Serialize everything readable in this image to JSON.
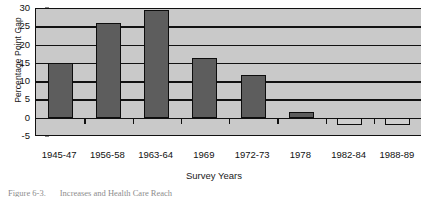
{
  "chart_data": {
    "type": "bar",
    "title": "",
    "xlabel": "Survey Years",
    "ylabel": "Percentage Point Gap",
    "categories": [
      "1945-47",
      "1956-58",
      "1963-64",
      "1969",
      "1972-73",
      "1978",
      "1982-84",
      "1988-89"
    ],
    "values": [
      15,
      26,
      29.5,
      16.3,
      11.8,
      1.5,
      -2,
      -2
    ],
    "ylim": [
      -5,
      30
    ],
    "yticks": [
      -5,
      0,
      5,
      10,
      15,
      20,
      25,
      30
    ],
    "ytick_labels": [
      "-5",
      "0",
      "5",
      "10",
      "15",
      "20",
      "25",
      "30"
    ],
    "grid": true,
    "legend": false,
    "series": [
      {
        "name": "Percentage Point Gap",
        "values": [
          15,
          26,
          29.5,
          16.3,
          11.8,
          1.5,
          -2,
          -2
        ]
      }
    ],
    "colors": {
      "positive_bar_fill": "#5d5d5d",
      "negative_bar_fill": "#cfcfcf",
      "bar_border": "#0d0d0d",
      "plot_background": "#c9c9c9",
      "gridline": "#111111",
      "axis": "#111111"
    }
  },
  "caption": {
    "number": "Figure 6-3.",
    "text": "Increases and Health Care Reach"
  }
}
